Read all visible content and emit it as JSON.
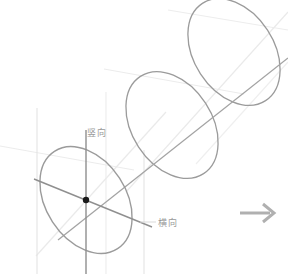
{
  "figure": {
    "type": "technical-line-drawing",
    "title": "",
    "background_color": "#ffffff",
    "width": 288,
    "height": 274
  },
  "colors": {
    "ellipse_stroke": "#9b9b9b",
    "axis_stroke": "#8f8f8f",
    "construction_stroke": "#e3e3e3",
    "faint_stroke": "#ededed",
    "center_dot": "#1a1a1a",
    "label_text": "#9a9a9a",
    "arrow": "#b0b0b0"
  },
  "labels": {
    "vertical": {
      "text": "竖向",
      "meaning": "vertical-direction",
      "x": 87,
      "y": 136
    },
    "horizontal": {
      "text": "横向",
      "meaning": "horizontal-direction",
      "x": 158,
      "y": 226
    }
  },
  "ellipses": [
    {
      "name": "front-ellipse",
      "cx": 86,
      "cy": 200,
      "rx": 40,
      "ry": 58,
      "rotation": -33
    },
    {
      "name": "middle-ellipse",
      "cx": 172,
      "cy": 125,
      "rx": 40,
      "ry": 58,
      "rotation": -33
    },
    {
      "name": "back-ellipse",
      "cx": 234,
      "cy": 52,
      "rx": 40,
      "ry": 58,
      "rotation": -33
    }
  ],
  "center_dot": {
    "name": "ellipse-center-point",
    "cx": 86,
    "cy": 200,
    "r": 3
  },
  "axes": {
    "vertical_axis": {
      "label_ref": "竖向",
      "x1": 86,
      "y1": 130,
      "x2": 86,
      "y2": 274
    },
    "major_axis": {
      "label_ref": "横向",
      "x1": 36,
      "y1": 178,
      "x2": 152,
      "y2": 226
    },
    "minor_axis": {
      "x1": 58,
      "y1": 246,
      "x2": 120,
      "y2": 160
    },
    "main_diagonal": {
      "x1": 60,
      "y1": 238,
      "x2": 288,
      "y2": 58
    }
  },
  "construction_lines": [
    {
      "name": "left-vertical-guide",
      "x1": 37,
      "y1": 108,
      "x2": 37,
      "y2": 274
    },
    {
      "name": "right-vertical-guide",
      "x1": 144,
      "y1": 152,
      "x2": 144,
      "y2": 274
    },
    {
      "name": "mid-vertical-guide",
      "x1": 106,
      "y1": 92,
      "x2": 106,
      "y2": 274
    },
    {
      "name": "upper-left-ray",
      "x1": 0,
      "y1": 145,
      "x2": 132,
      "y2": 168
    },
    {
      "name": "upper-mid-ray",
      "x1": 104,
      "y1": 68,
      "x2": 240,
      "y2": 92
    },
    {
      "name": "diag-guide-lower",
      "x1": 40,
      "y1": 252,
      "x2": 160,
      "y2": 120
    },
    {
      "name": "diag-guide-upper",
      "x1": 130,
      "y1": 186,
      "x2": 288,
      "y2": 14
    }
  ],
  "arrow": {
    "name": "right-arrow",
    "direction": "right",
    "x": 240,
    "y": 213,
    "length": 34,
    "head_size": 8
  }
}
